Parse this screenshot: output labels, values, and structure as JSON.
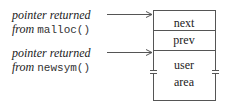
{
  "labels": [
    {
      "line1": "pointer returned",
      "prefix": "from",
      "func": "malloc()"
    },
    {
      "line1": "pointer returned",
      "prefix": "from",
      "func": "newsym()"
    }
  ],
  "block": {
    "fields": [
      "next",
      "prev"
    ],
    "user_area": [
      "user",
      "area"
    ]
  }
}
